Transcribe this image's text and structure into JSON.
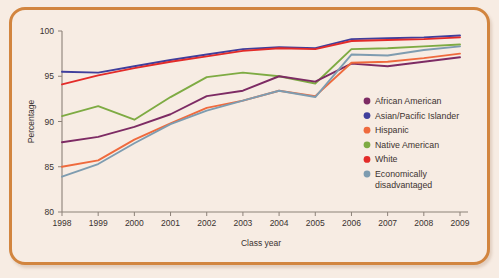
{
  "figure": {
    "background_color": "#f7ece3",
    "border_color": "#d2853f"
  },
  "chart_data": {
    "type": "line",
    "title": "",
    "xlabel": "Class year",
    "ylabel": "Percentage",
    "x": [
      1998,
      1999,
      2000,
      2001,
      2002,
      2003,
      2004,
      2005,
      2006,
      2007,
      2008,
      2009
    ],
    "xtick_labels": [
      "1998",
      "1999",
      "2000",
      "2001",
      "2002",
      "2003",
      "2004",
      "2005",
      "2006",
      "2007",
      "2008",
      "2009"
    ],
    "ytick_labels": [
      "80",
      "85",
      "90",
      "95",
      "100"
    ],
    "yticks": [
      80,
      85,
      90,
      95,
      100
    ],
    "ylim": [
      80,
      100
    ],
    "xlim": [
      1998,
      2009
    ],
    "grid": false,
    "legend_position": "inside-right",
    "series": [
      {
        "name": "African American",
        "color": "#7d2b64",
        "values": [
          87.7,
          88.3,
          89.4,
          90.8,
          92.8,
          93.4,
          95.0,
          94.4,
          96.4,
          96.1,
          96.6,
          97.1
        ]
      },
      {
        "name": "Asian/Pacific Islander",
        "color": "#403f9c",
        "values": [
          95.5,
          95.4,
          96.1,
          96.8,
          97.4,
          98.0,
          98.2,
          98.1,
          99.1,
          99.2,
          99.3,
          99.5
        ]
      },
      {
        "name": "Hispanic",
        "color": "#ef6a3d",
        "values": [
          85.0,
          85.7,
          88.0,
          89.8,
          91.5,
          92.3,
          93.4,
          92.8,
          96.5,
          96.6,
          97.0,
          97.5
        ]
      },
      {
        "name": "Native American",
        "color": "#7eab43",
        "values": [
          90.6,
          91.7,
          90.2,
          92.7,
          94.9,
          95.4,
          95.0,
          94.2,
          98.0,
          98.1,
          98.3,
          98.5
        ]
      },
      {
        "name": "White",
        "color": "#e32b29",
        "values": [
          94.1,
          95.1,
          95.9,
          96.6,
          97.2,
          97.8,
          98.1,
          98.0,
          98.9,
          99.0,
          99.1,
          99.3
        ]
      },
      {
        "name": "Economically disadvantaged",
        "color": "#7e9cb0",
        "values": [
          83.9,
          85.3,
          87.6,
          89.7,
          91.2,
          92.3,
          93.4,
          92.7,
          97.4,
          97.3,
          97.9,
          98.3
        ]
      }
    ]
  },
  "legend": {
    "entries": [
      {
        "label": "African American",
        "color": "#7d2b64"
      },
      {
        "label": "Asian/Pacific Islander",
        "color": "#403f9c"
      },
      {
        "label": "Hispanic",
        "color": "#ef6a3d"
      },
      {
        "label": "Native American",
        "color": "#7eab43"
      },
      {
        "label": "White",
        "color": "#e32b29"
      },
      {
        "label": "Economically",
        "label2": "disadvantaged",
        "color": "#7e9cb0"
      }
    ]
  }
}
